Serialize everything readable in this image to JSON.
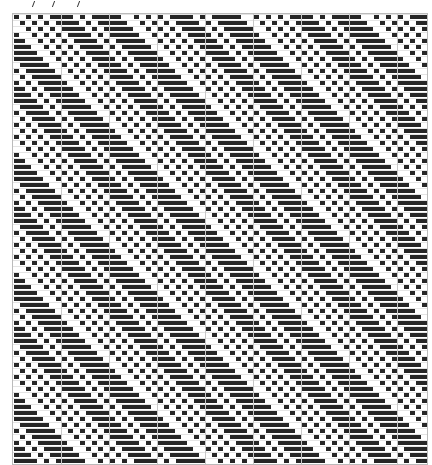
{
  "draft": {
    "type": "weave-pattern",
    "columns": 69,
    "rows": 75,
    "shift_per_row": 1,
    "base_row": [
      1,
      0,
      1,
      0,
      1,
      0,
      1,
      1,
      1,
      1,
      0,
      1,
      0,
      1,
      1,
      1,
      1,
      1,
      0,
      0
    ],
    "colors": {
      "filled": "#262626",
      "empty": "#ffffff",
      "grid": "#c8c8c8"
    },
    "major_grid_every": 8
  },
  "ticks": {
    "count": 3
  }
}
